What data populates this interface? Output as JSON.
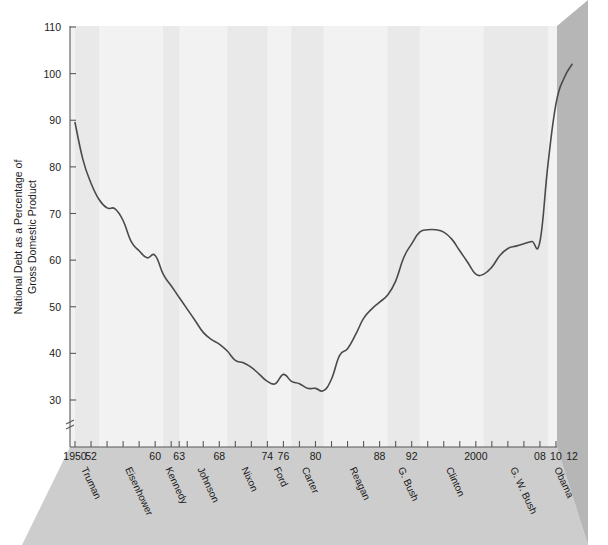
{
  "chart_data": {
    "type": "line",
    "title": "",
    "xlabel": "",
    "ylabel": "National Debt as a Percentage of Gross Domestic Product",
    "ylim": [
      30,
      110
    ],
    "xlim": [
      1950,
      2012
    ],
    "yticks": [
      30,
      40,
      50,
      60,
      70,
      80,
      90,
      100,
      110
    ],
    "ytick_labels": [
      "30",
      "40",
      "50",
      "60",
      "70",
      "80",
      "90",
      "100",
      "110"
    ],
    "axis_break": true,
    "axis_break_symbol": "≈",
    "xtick_years": [
      1950,
      1952,
      1954,
      1956,
      1958,
      1960,
      1962,
      1963,
      1964,
      1966,
      1968,
      1970,
      1972,
      1974,
      1976,
      1978,
      1980,
      1982,
      1984,
      1986,
      1988,
      1990,
      1992,
      1994,
      1996,
      1998,
      2000,
      2002,
      2004,
      2006,
      2008,
      2010,
      2012
    ],
    "xtick_labels": [
      {
        "year": 1950,
        "label": "1950"
      },
      {
        "year": 1952,
        "label": "52"
      },
      {
        "year": 1960,
        "label": "60"
      },
      {
        "year": 1963,
        "label": "63"
      },
      {
        "year": 1968,
        "label": "68"
      },
      {
        "year": 1974,
        "label": "74"
      },
      {
        "year": 1976,
        "label": "76"
      },
      {
        "year": 1980,
        "label": "80"
      },
      {
        "year": 1988,
        "label": "88"
      },
      {
        "year": 1992,
        "label": "92"
      },
      {
        "year": 2000,
        "label": "2000"
      },
      {
        "year": 2008,
        "label": "08"
      },
      {
        "year": 2010,
        "label": "10"
      },
      {
        "year": 2012,
        "label": "12"
      }
    ],
    "grid": false,
    "legend": "none",
    "series": [
      {
        "name": "National Debt as % of GDP",
        "x": [
          1950,
          1951,
          1952,
          1953,
          1954,
          1955,
          1956,
          1957,
          1958,
          1959,
          1960,
          1961,
          1962,
          1963,
          1964,
          1965,
          1966,
          1967,
          1968,
          1969,
          1970,
          1971,
          1972,
          1973,
          1974,
          1975,
          1976,
          1977,
          1978,
          1979,
          1980,
          1981,
          1982,
          1983,
          1984,
          1985,
          1986,
          1987,
          1988,
          1989,
          1990,
          1991,
          1992,
          1993,
          1994,
          1995,
          1996,
          1997,
          1998,
          1999,
          2000,
          2001,
          2002,
          2003,
          2004,
          2005,
          2006,
          2007,
          2008,
          2009,
          2010,
          2011,
          2012
        ],
        "values": [
          89.5,
          81.5,
          76.5,
          73.0,
          71.2,
          71.0,
          68.5,
          64.0,
          62.0,
          60.5,
          61.0,
          57.0,
          54.5,
          52.0,
          49.5,
          47.0,
          44.5,
          43.0,
          42.0,
          40.5,
          38.5,
          38.0,
          37.0,
          35.5,
          34.0,
          33.5,
          35.5,
          34.0,
          33.5,
          32.5,
          32.5,
          32.0,
          34.5,
          39.5,
          41.0,
          44.0,
          47.5,
          49.5,
          51.0,
          52.5,
          55.5,
          60.5,
          63.5,
          66.0,
          66.5,
          66.5,
          66.0,
          64.5,
          62.0,
          59.5,
          57.0,
          57.0,
          58.5,
          61.0,
          62.5,
          63.0,
          63.5,
          64.0,
          64.0,
          80.5,
          93.5,
          99.0,
          102.0
        ]
      }
    ],
    "annotations": {
      "presidents": [
        {
          "name": "Truman",
          "start": 1950,
          "end": 1953
        },
        {
          "name": "Eisenhower",
          "start": 1953,
          "end": 1961
        },
        {
          "name": "Kennedy",
          "start": 1961,
          "end": 1963
        },
        {
          "name": "Johnson",
          "start": 1963,
          "end": 1969
        },
        {
          "name": "Nixon",
          "start": 1969,
          "end": 1974
        },
        {
          "name": "Ford",
          "start": 1974,
          "end": 1977
        },
        {
          "name": "Carter",
          "start": 1977,
          "end": 1981
        },
        {
          "name": "Reagan",
          "start": 1981,
          "end": 1989
        },
        {
          "name": "G. Bush",
          "start": 1989,
          "end": 1993
        },
        {
          "name": "Clinton",
          "start": 1993,
          "end": 2001
        },
        {
          "name": "G. W. Bush",
          "start": 2001,
          "end": 2009
        },
        {
          "name": "Obama",
          "start": 2009,
          "end": 2012
        }
      ]
    },
    "colors": {
      "line": "#4a4a4a",
      "plot_background": "#f2f2f2",
      "band_alternate": "#e9e9e9",
      "right_wall": "#b6b6b6",
      "floor": "#cdcdcd",
      "axis": "#595959",
      "text": "#1b1b1b"
    }
  }
}
